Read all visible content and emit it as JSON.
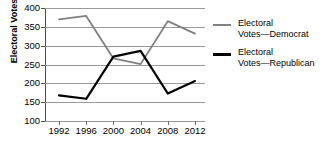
{
  "chart_data": {
    "type": "line",
    "title": "",
    "xlabel": "",
    "ylabel": "Electoral Votes",
    "categories": [
      "1992",
      "1996",
      "2000",
      "2004",
      "2008",
      "2012"
    ],
    "x": [
      1992,
      1996,
      2000,
      2004,
      2008,
      2012
    ],
    "ylim": [
      100,
      400
    ],
    "yticks": [
      100,
      150,
      200,
      250,
      300,
      350,
      400
    ],
    "ytick_labels": [
      "100",
      "150",
      "200",
      "250",
      "300",
      "350",
      "400"
    ],
    "grid": true,
    "legend_position": "right",
    "series": [
      {
        "name": "Electoral Votes—Democrat",
        "name_line1": "Electoral",
        "name_line2": "Votes—Democrat",
        "color": "#808080",
        "values": [
          370,
          379,
          266,
          251,
          365,
          332
        ]
      },
      {
        "name": "Electoral Votes—Republican",
        "name_line1": "Electoral",
        "name_line2": "Votes—Republican",
        "color": "#000000",
        "values": [
          168,
          159,
          271,
          286,
          173,
          206
        ]
      }
    ]
  }
}
